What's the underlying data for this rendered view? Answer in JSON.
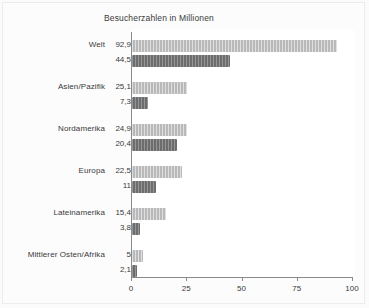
{
  "chart_data": {
    "type": "bar",
    "orientation": "horizontal",
    "title": "Besucherzahlen in Millionen",
    "xlabel": "",
    "ylabel": "",
    "xlim": [
      0,
      100
    ],
    "xticks": [
      "0",
      "25",
      "50",
      "75",
      "100"
    ],
    "grid": false,
    "legend": "none",
    "categories": [
      "Welt",
      "Asien/Pazifik",
      "Nordamerika",
      "Europa",
      "Lateinamerika",
      "Mittlerer Osten/Afrika"
    ],
    "series": [
      {
        "name": "light",
        "color": "#b9b9b9",
        "values": [
          92.9,
          25.1,
          24.9,
          22.5,
          15.4,
          5
        ],
        "value_labels": [
          "92,9",
          "25,1",
          "24,9",
          "22,5",
          "15,4",
          "5"
        ]
      },
      {
        "name": "dark",
        "color": "#6d6d6d",
        "values": [
          44.5,
          7.3,
          20.4,
          11,
          3.8,
          2.1
        ],
        "value_labels": [
          "44,5",
          "7,3",
          "20,4",
          "11",
          "3,8",
          "2,1"
        ]
      }
    ]
  },
  "colors": {
    "light_bar": "#b9b9b9",
    "dark_bar": "#6d6d6d",
    "axis": "#8a8a8a",
    "text": "#3a3a3a",
    "panel_background": "#fcfcfc",
    "plot_background": "#ffffff"
  }
}
